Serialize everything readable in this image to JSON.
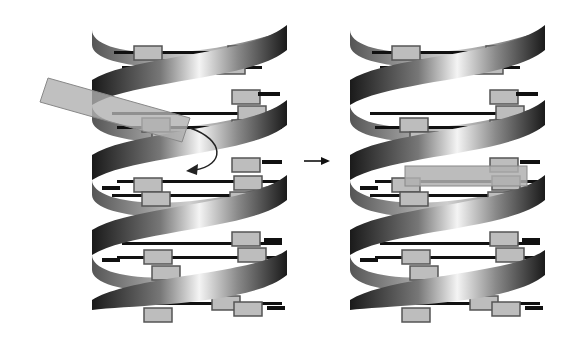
{
  "figure": {
    "type": "diagram",
    "panels": [
      {
        "id": "before",
        "description": "double helix with planar molecule approaching (curved arrow into helix)"
      },
      {
        "id": "after",
        "description": "double helix with molecule intercalated between base pairs"
      }
    ],
    "arrow": {
      "direction": "right"
    },
    "colors": {
      "background": "#ffffff",
      "base_fill": "#bdbdbd",
      "base_stroke": "#555555",
      "bar": "#111111",
      "ribbon_dark": "#1a1a1a",
      "ribbon_light": "#f2f2f2",
      "intercalator": "#b0b0b0"
    }
  }
}
